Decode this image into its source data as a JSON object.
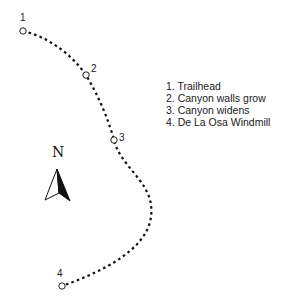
{
  "map": {
    "route": {
      "style": "dotted",
      "color": "#111111",
      "path": "M23,31 C45,36 70,52 86,75 C98,95 108,118 114,140 C120,165 148,180 151,205 C155,235 130,262 62,286"
    },
    "waypoints": [
      {
        "id": "1",
        "label": "1",
        "name": "Trailhead",
        "x": 23,
        "y": 31,
        "label_x": 20,
        "label_y": 13
      },
      {
        "id": "2",
        "label": "2",
        "name": "Canyon walls grow",
        "x": 86,
        "y": 75,
        "label_x": 91,
        "label_y": 64
      },
      {
        "id": "3",
        "label": "3",
        "name": "Canyon widens",
        "x": 114,
        "y": 140,
        "label_x": 119,
        "label_y": 133
      },
      {
        "id": "4",
        "label": "4",
        "name": "De La Osa Windmill",
        "x": 62,
        "y": 286,
        "label_x": 57,
        "label_y": 269
      }
    ],
    "legend": {
      "items": [
        "1. Trailhead",
        "2. Canyon walls grow",
        "3. Canyon widens",
        "4. De La Osa Windmill"
      ]
    },
    "compass": {
      "label": "N",
      "icon": "north-arrow-icon"
    }
  }
}
